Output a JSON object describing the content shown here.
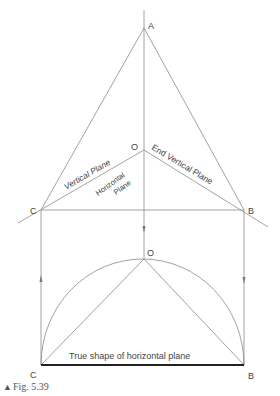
{
  "diagram": {
    "points": {
      "A": "A",
      "O_top": "O",
      "C_top": "C",
      "B_top": "B",
      "O_bottom": "O",
      "C_bottom": "C",
      "B_bottom": "B"
    },
    "labels": {
      "vertical_plane": "Vertical Plane",
      "end_vertical_plane": "End Vertical Plane",
      "horizontal_1": "Horizontal",
      "horizontal_2": "Plane",
      "true_shape": "True shape of horizontal plane"
    },
    "caption": {
      "marker": "▲",
      "text": "Fig. 5.39"
    },
    "line_color": "#8a8a8a",
    "thick_line_color": "#222222"
  }
}
